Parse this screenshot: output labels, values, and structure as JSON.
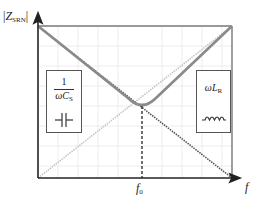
{
  "diagram": {
    "y_axis": {
      "label_main": "Z",
      "label_sub": "SRN",
      "label_bars": "|"
    },
    "x_axis": {
      "label": "f"
    },
    "resonance": {
      "label_main": "f",
      "label_sub": "0"
    },
    "capacitor_box": {
      "numerator": "1",
      "denominator_main": "ωC",
      "denominator_sub": "S",
      "icon": "capacitor-icon"
    },
    "inductor_box": {
      "expr_main": "ωL",
      "expr_sub": "R",
      "icon": "inductor-icon"
    },
    "colors": {
      "axis": "#222222",
      "frame": "#777777",
      "grid": "#e6e6e6",
      "impedance_curve": "#8a8a8a",
      "capacitive_line": "#555555",
      "inductive_line": "#c8c8c8",
      "resonance_marker": "#333333"
    }
  }
}
